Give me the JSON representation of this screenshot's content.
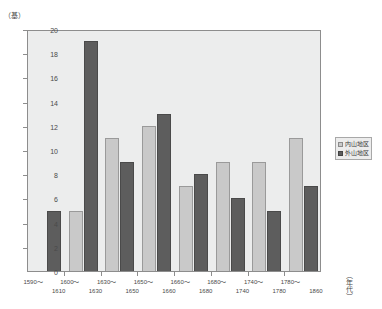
{
  "chart_data": {
    "type": "bar",
    "title": "",
    "xlabel": "（年代）",
    "ylabel": "（基）",
    "ylim": [
      0,
      20
    ],
    "ytick_step": 2,
    "yticks": [
      20,
      18,
      16,
      14,
      12,
      10,
      8,
      6,
      4,
      2,
      0
    ],
    "grid": false,
    "legend_position": "right",
    "categories": [
      "1590～\n1610",
      "1600～\n1630",
      "1630～\n1650",
      "1650～\n1660",
      "1660～\n1680",
      "1680～\n1740",
      "1740～\n1780",
      "1780～\n1860"
    ],
    "category_lines": [
      {
        "top": "1590～",
        "bottom": "1610"
      },
      {
        "top": "1600～",
        "bottom": "1630"
      },
      {
        "top": "1630～",
        "bottom": "1650"
      },
      {
        "top": "1650～",
        "bottom": "1660"
      },
      {
        "top": "1660～",
        "bottom": "1680"
      },
      {
        "top": "1680～",
        "bottom": "1740"
      },
      {
        "top": "1740～",
        "bottom": "1780"
      },
      {
        "top": "1780～",
        "bottom": "1860"
      }
    ],
    "series": [
      {
        "name": "内山地区",
        "color": "#c9c9c9",
        "values": [
          0,
          5,
          11,
          12,
          7,
          9,
          9,
          11
        ]
      },
      {
        "name": "外山地区",
        "color": "#5d5d5d",
        "values": [
          5,
          19,
          9,
          13,
          8,
          6,
          5,
          7
        ]
      }
    ]
  },
  "axes": {
    "y_unit_label": "（基）",
    "x_title": "（年代）"
  },
  "legend": {
    "items": [
      {
        "label": "内山地区",
        "series": 0
      },
      {
        "label": "外山地区",
        "series": 1
      }
    ]
  },
  "title_strip": {
    "text": ""
  }
}
